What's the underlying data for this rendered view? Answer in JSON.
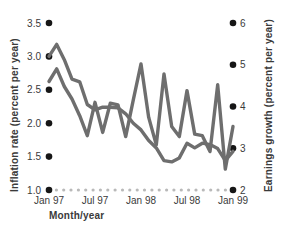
{
  "chart_data": {
    "type": "line",
    "title": "",
    "xlabel": "Month/year",
    "grid": false,
    "legend": "none",
    "x": [
      "Jan 97",
      "Feb 97",
      "Mar 97",
      "Apr 97",
      "May 97",
      "Jun 97",
      "Jul 97",
      "Aug 97",
      "Sep 97",
      "Oct 97",
      "Nov 97",
      "Dec 97",
      "Jan 98",
      "Feb 98",
      "Mar 98",
      "Apr 98",
      "May 98",
      "Jun 98",
      "Jul 98",
      "Aug 98",
      "Sep 98",
      "Oct 98",
      "Nov 98",
      "Dec 98",
      "Jan 99"
    ],
    "x_tick_labels": [
      "Jan 97",
      "Jul 97",
      "Jan 98",
      "Jul 98",
      "Jan 99"
    ],
    "left_axis": {
      "label": "Inflation rate (percent per year)",
      "ticks": [
        "3.5",
        "3.0",
        "2.5",
        "2.0",
        "1.5",
        "1.0"
      ],
      "tick_values": [
        3.5,
        3.0,
        2.5,
        2.0,
        1.5,
        1.0
      ],
      "ylim": [
        1.0,
        3.5
      ]
    },
    "right_axis": {
      "label": "Earnings growth (percent per year)",
      "ticks": [
        "6",
        "5",
        "4",
        "3",
        "2"
      ],
      "tick_values": [
        6,
        5,
        4,
        3,
        2
      ],
      "ylim": [
        2,
        6
      ]
    },
    "series": [
      {
        "name": "Inflation rate",
        "axis": "left",
        "color": "#6e6e6e",
        "values": [
          3.0,
          3.18,
          2.95,
          2.66,
          2.62,
          2.28,
          2.2,
          2.24,
          2.24,
          2.23,
          2.14,
          2.0,
          1.9,
          1.74,
          1.63,
          1.44,
          1.42,
          1.48,
          1.7,
          1.63,
          1.7,
          1.68,
          1.62,
          1.44,
          1.58
        ]
      },
      {
        "name": "Earnings growth",
        "axis": "right",
        "color": "#6e6e6e",
        "values": [
          4.6,
          4.9,
          4.48,
          4.18,
          3.78,
          3.3,
          4.1,
          3.38,
          4.08,
          4.04,
          3.28,
          4.16,
          5.02,
          3.74,
          3.08,
          4.78,
          3.52,
          3.28,
          4.38,
          3.34,
          3.3,
          2.92,
          4.52,
          2.5,
          3.52
        ]
      }
    ]
  },
  "axis_titles": {
    "x": "Month/year",
    "left": "Inflation rate (percent per year)",
    "right": "Earnings growth (percent per year)"
  }
}
